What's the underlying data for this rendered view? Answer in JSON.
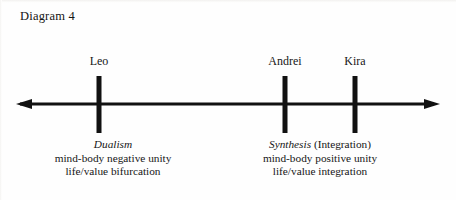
{
  "diagram": {
    "title": "Diagram 4",
    "type": "number-line",
    "axis": {
      "left_arrow": true,
      "right_arrow": true,
      "line_y": 104,
      "x_start": 16,
      "x_end": 440,
      "color": "#111111"
    },
    "nodes": [
      {
        "id": "leo",
        "name": "Leo",
        "x": 99,
        "tick": {
          "top": 76,
          "bottom": 133,
          "width": 5
        },
        "description": {
          "term": "Dualism",
          "qualifier": "",
          "lines": [
            "mind-body negative unity",
            "life/value bifurcation"
          ]
        }
      },
      {
        "id": "andrei",
        "name": "Andrei",
        "x": 285,
        "tick": {
          "top": 76,
          "bottom": 133,
          "width": 5
        },
        "description": {
          "term": "Synthesis",
          "qualifier": " (Integration)",
          "lines": [
            "mind-body positive unity",
            "life/value integration"
          ]
        }
      },
      {
        "id": "kira",
        "name": "Kira",
        "x": 355,
        "tick": {
          "top": 76,
          "bottom": 133,
          "width": 5
        },
        "description": null
      }
    ],
    "description_blocks": [
      {
        "id": "dualism-block",
        "center_x": 113
      },
      {
        "id": "synthesis-block",
        "center_x": 320
      }
    ],
    "colors": {
      "ink": "#161616",
      "background": "#fefefe"
    }
  }
}
